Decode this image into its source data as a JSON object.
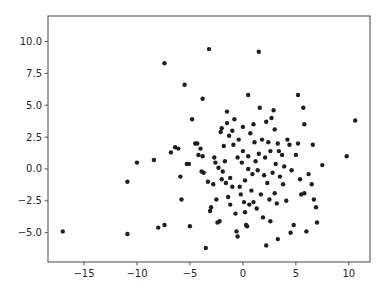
{
  "chart_data": {
    "type": "scatter",
    "title": "",
    "xlabel": "",
    "ylabel": "",
    "xlim": [
      -18.4,
      12.0
    ],
    "ylim": [
      -7.3,
      12.0
    ],
    "grid": false,
    "legend": null,
    "marker_color": "#1f1f1f",
    "x_ticks": [
      -15,
      -10,
      -5,
      0,
      5,
      10
    ],
    "x_tick_labels": [
      "−15",
      "−10",
      "−5",
      "0",
      "5",
      "10"
    ],
    "y_ticks": [
      -5.0,
      -2.5,
      0.0,
      2.5,
      5.0,
      7.5,
      10.0
    ],
    "y_tick_labels": [
      "−5.0",
      "−2.5",
      "0.0",
      "2.5",
      "5.0",
      "7.5",
      "10.0"
    ],
    "series": [
      {
        "name": "points",
        "points": [
          [
            -17.0,
            -4.9
          ],
          [
            -10.9,
            -1.0
          ],
          [
            -10.9,
            -5.1
          ],
          [
            -10.0,
            0.5
          ],
          [
            -8.4,
            0.7
          ],
          [
            -8.0,
            -4.6
          ],
          [
            -7.4,
            -4.4
          ],
          [
            -7.4,
            8.3
          ],
          [
            -6.8,
            1.3
          ],
          [
            -6.4,
            1.7
          ],
          [
            -6.1,
            1.6
          ],
          [
            -5.8,
            -2.4
          ],
          [
            -5.9,
            -0.6
          ],
          [
            -5.5,
            6.6
          ],
          [
            -5.3,
            0.4
          ],
          [
            -5.1,
            0.4
          ],
          [
            -5.0,
            -4.5
          ],
          [
            -4.8,
            3.9
          ],
          [
            -4.5,
            2.0
          ],
          [
            -4.3,
            2.0
          ],
          [
            -4.2,
            1.1
          ],
          [
            -4.0,
            1.6
          ],
          [
            -3.8,
            5.5
          ],
          [
            -3.8,
            1.0
          ],
          [
            -3.9,
            -0.2
          ],
          [
            -3.7,
            -0.3
          ],
          [
            -3.5,
            -6.2
          ],
          [
            -3.3,
            -1.0
          ],
          [
            -3.2,
            9.4
          ],
          [
            -3.1,
            -3.3
          ],
          [
            -3.0,
            -3.0
          ],
          [
            -2.8,
            -1.2
          ],
          [
            -2.7,
            0.9
          ],
          [
            -2.6,
            0.5
          ],
          [
            -2.5,
            -2.4
          ],
          [
            -2.4,
            -4.2
          ],
          [
            -2.2,
            -4.1
          ],
          [
            -2.3,
            0.1
          ],
          [
            -2.1,
            2.9
          ],
          [
            -2.0,
            3.2
          ],
          [
            -2.0,
            -0.8
          ],
          [
            -1.9,
            -0.2
          ],
          [
            -1.8,
            1.8
          ],
          [
            -1.7,
            0.6
          ],
          [
            -1.6,
            -1.1
          ],
          [
            -1.5,
            4.5
          ],
          [
            -1.5,
            3.6
          ],
          [
            -1.4,
            -2.2
          ],
          [
            -1.3,
            2.6
          ],
          [
            -1.2,
            -2.8
          ],
          [
            -1.2,
            -0.7
          ],
          [
            -1.0,
            -1.4
          ],
          [
            -1.0,
            3.0
          ],
          [
            -0.9,
            1.9
          ],
          [
            -0.8,
            3.9
          ],
          [
            -0.7,
            -3.5
          ],
          [
            -0.6,
            -4.9
          ],
          [
            -0.5,
            -5.3
          ],
          [
            -0.5,
            0.9
          ],
          [
            -0.4,
            2.3
          ],
          [
            -0.3,
            -1.4
          ],
          [
            -0.2,
            -2.0
          ],
          [
            -0.1,
            0.5
          ],
          [
            0.0,
            3.3
          ],
          [
            0.0,
            1.4
          ],
          [
            0.1,
            -2.6
          ],
          [
            0.2,
            -0.9
          ],
          [
            0.2,
            -3.4
          ],
          [
            0.3,
            -4.4
          ],
          [
            0.4,
            -4.5
          ],
          [
            0.5,
            1.0
          ],
          [
            0.5,
            5.8
          ],
          [
            0.5,
            0.0
          ],
          [
            0.6,
            -2.8
          ],
          [
            0.7,
            2.8
          ],
          [
            0.8,
            -1.7
          ],
          [
            0.9,
            -0.4
          ],
          [
            1.0,
            3.5
          ],
          [
            1.0,
            -2.6
          ],
          [
            1.1,
            2.1
          ],
          [
            1.2,
            0.6
          ],
          [
            1.3,
            -3.1
          ],
          [
            1.4,
            -0.1
          ],
          [
            1.5,
            1.2
          ],
          [
            1.5,
            9.2
          ],
          [
            1.6,
            4.8
          ],
          [
            1.7,
            -2.0
          ],
          [
            1.8,
            2.3
          ],
          [
            1.9,
            -3.8
          ],
          [
            2.0,
            -0.5
          ],
          [
            2.1,
            0.9
          ],
          [
            2.2,
            -6.0
          ],
          [
            2.2,
            3.7
          ],
          [
            2.3,
            -1.1
          ],
          [
            2.4,
            2.1
          ],
          [
            2.5,
            -2.4
          ],
          [
            2.6,
            1.4
          ],
          [
            2.6,
            -4.1
          ],
          [
            2.7,
            4.0
          ],
          [
            2.8,
            -0.3
          ],
          [
            2.9,
            4.6
          ],
          [
            3.0,
            -1.9
          ],
          [
            3.0,
            3.1
          ],
          [
            3.1,
            0.4
          ],
          [
            3.2,
            -2.7
          ],
          [
            3.3,
            -5.5
          ],
          [
            3.3,
            2.0
          ],
          [
            3.4,
            1.4
          ],
          [
            3.5,
            -0.6
          ],
          [
            3.7,
            1.1
          ],
          [
            3.8,
            -1.2
          ],
          [
            3.9,
            0.2
          ],
          [
            4.1,
            -2.5
          ],
          [
            4.2,
            2.3
          ],
          [
            4.4,
            1.9
          ],
          [
            4.5,
            -5.0
          ],
          [
            4.6,
            -0.1
          ],
          [
            4.8,
            -4.4
          ],
          [
            5.0,
            1.1
          ],
          [
            5.2,
            5.8
          ],
          [
            5.2,
            2.0
          ],
          [
            5.4,
            -0.8
          ],
          [
            5.5,
            -2.0
          ],
          [
            5.7,
            4.8
          ],
          [
            5.8,
            3.5
          ],
          [
            5.8,
            -1.9
          ],
          [
            6.0,
            -4.9
          ],
          [
            6.2,
            -0.4
          ],
          [
            6.5,
            -1.2
          ],
          [
            6.6,
            1.9
          ],
          [
            6.7,
            -2.4
          ],
          [
            6.9,
            -3.0
          ],
          [
            7.0,
            -4.2
          ],
          [
            7.5,
            0.3
          ],
          [
            9.8,
            1.0
          ],
          [
            10.6,
            3.8
          ]
        ]
      }
    ]
  }
}
